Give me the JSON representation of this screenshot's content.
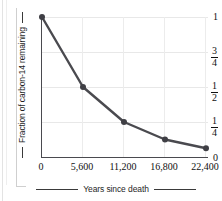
{
  "figure": {
    "background": "#ffffff",
    "line_color": "#4a4a4f",
    "marker_color": "#3f3f45",
    "grid_color": "#e8e8e8",
    "axis_color": "#4a4a4f"
  },
  "chart_data": {
    "type": "line",
    "title": "",
    "xlabel": "Years since death",
    "ylabel": "Fraction of carbon-14 remaining",
    "x": [
      0,
      5600,
      11200,
      16800,
      22400
    ],
    "values": [
      1,
      0.5,
      0.25,
      0.125,
      0.0625
    ],
    "y_value_labels": [
      "1",
      "1/2",
      "1/4",
      "1/8",
      "1/16"
    ],
    "xtick_labels": [
      "0",
      "5,600",
      "11,200",
      "16,800",
      "22,400"
    ],
    "xtick_values": [
      0,
      5600,
      11200,
      16800,
      22400
    ],
    "ytick_labels": [
      "1",
      "3/4",
      "1/2",
      "1/4",
      "0"
    ],
    "ytick_values": [
      1,
      0.75,
      0.5,
      0.25,
      0
    ],
    "ytick_fractions": [
      {
        "whole": "1",
        "num": "",
        "den": ""
      },
      {
        "whole": "",
        "num": "3",
        "den": "4"
      },
      {
        "whole": "",
        "num": "1",
        "den": "2"
      },
      {
        "whole": "",
        "num": "1",
        "den": "4"
      },
      {
        "whole": "0",
        "num": "",
        "den": ""
      }
    ],
    "xlim": [
      0,
      22400
    ],
    "ylim": [
      0,
      1
    ],
    "grid": true,
    "legend": "none",
    "markers": "filled-circle",
    "half_life_years": 5600
  }
}
